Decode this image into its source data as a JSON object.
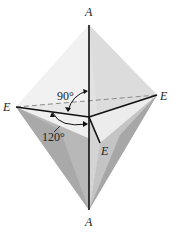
{
  "diagram": {
    "type": "trigonal-bipyramid",
    "vertices": {
      "axial_top": {
        "label": "A",
        "x": 89,
        "y": 25
      },
      "axial_bottom": {
        "label": "A",
        "x": 89,
        "y": 210
      },
      "equatorial_left": {
        "label": "E",
        "x": 16,
        "y": 107
      },
      "equatorial_right": {
        "label": "E",
        "x": 157,
        "y": 95
      },
      "equatorial_front": {
        "label": "E",
        "x": 100,
        "y": 143
      },
      "center": {
        "x": 89,
        "y": 117
      }
    },
    "labels": {
      "top_axial": "A",
      "bottom_axial": "A",
      "left_equatorial": "E",
      "right_equatorial": "E",
      "front_equatorial": "E",
      "angle_axial_equatorial": "90°",
      "angle_equatorial_equatorial": "120°"
    },
    "colors": {
      "background": "#ffffff",
      "face_light": "#ebebeb",
      "face_mid": "#d6d6d6",
      "face_dark": "#b4b4b4",
      "face_darker": "#a3a3a3",
      "edge": "#111111",
      "dashed": "#888888"
    }
  }
}
